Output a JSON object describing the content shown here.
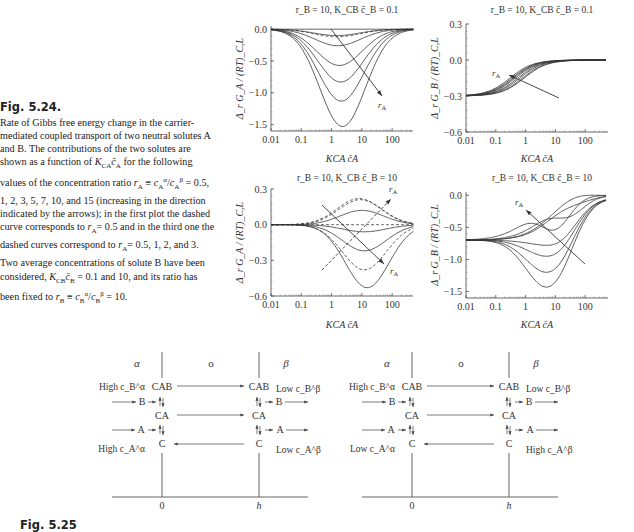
{
  "figure_5_24": {
    "label": "Fig. 5.24.",
    "caption": "Rate of Gibbs free energy change in the carrier-mediated coupled transport of two neutral solutes A and B. The contributions of the two solutes are shown as a function of K_CA c̄_A for the following values of the concentration ratio r_A ≡ c_A^α/c_A^β = 0.5, 1, 2, 3, 5, 7, 10, and 15 (increasing in the direction indicated by the arrows); in the first plot the dashed curve corresponds to r_A= 0.5 and in the third one the dashed curves correspond to r_A= 0.5, 1, 2, and 3. Two average concentrations of solute B have been considered, K_CB c̄_B = 0.1 and 10, and its ratio has been fixed to r_B ≡ c_B^α/c_B^β = 10."
  },
  "figure_5_25": {
    "label": "Fig. 5.25"
  },
  "chart_data": [
    {
      "type": "line",
      "title": "r_B = 10, K_CB c̄_B = 0.1",
      "xlabel": "K_CA c̄_A",
      "ylabel": "Δ_r G_A / (RT)_C,L",
      "xscale": "log",
      "xticks": [
        "0.01",
        "0.1",
        "1",
        "10",
        "100"
      ],
      "yticks": [
        "0.0",
        "−0.5",
        "−1.0",
        "−1.5"
      ],
      "xlim": [
        0.01,
        500
      ],
      "ylim": [
        -1.6,
        0.05
      ],
      "annotation": "r_A (arrow pointing down-right)",
      "series": [
        {
          "r_A": 0.5,
          "style": "dashed",
          "min": -0.12,
          "x_at_min": 1.5
        },
        {
          "r_A": 1,
          "style": "solid",
          "min": 0.0,
          "x_at_min": 1.5
        },
        {
          "r_A": 2,
          "style": "solid",
          "min": -0.1,
          "x_at_min": 1.5
        },
        {
          "r_A": 3,
          "style": "solid",
          "min": -0.26,
          "x_at_min": 1.6
        },
        {
          "r_A": 5,
          "style": "solid",
          "min": -0.57,
          "x_at_min": 1.8
        },
        {
          "r_A": 7,
          "style": "solid",
          "min": -0.83,
          "x_at_min": 2.0
        },
        {
          "r_A": 10,
          "style": "solid",
          "min": -1.13,
          "x_at_min": 2.1
        },
        {
          "r_A": 15,
          "style": "solid",
          "min": -1.53,
          "x_at_min": 2.3
        }
      ]
    },
    {
      "type": "line",
      "title": "r_B = 10, K_CB c̄_B = 0.1",
      "xlabel": "K_CA c̄_A",
      "ylabel": "Δ_r G_B / (RT)_C,L",
      "xscale": "log",
      "xticks": [
        "0.01",
        "0.1",
        "1",
        "10",
        "100"
      ],
      "yticks": [
        "0.3",
        "0.0",
        "−0.3",
        "−0.6"
      ],
      "xlim": [
        0.01,
        500
      ],
      "ylim": [
        -0.6,
        0.3
      ],
      "annotation": "r_A (arrow pointing up-left)",
      "series": [
        {
          "r_A": 0.5,
          "start": -0.3,
          "end": 0.0,
          "x_mid": 0.9
        },
        {
          "r_A": 1,
          "start": -0.3,
          "end": 0.0,
          "x_mid": 0.8
        },
        {
          "r_A": 2,
          "start": -0.3,
          "end": 0.0,
          "x_mid": 0.65
        },
        {
          "r_A": 3,
          "start": -0.3,
          "end": 0.0,
          "x_mid": 0.55
        },
        {
          "r_A": 5,
          "start": -0.3,
          "end": 0.0,
          "x_mid": 0.45
        },
        {
          "r_A": 7,
          "start": -0.3,
          "end": 0.0,
          "x_mid": 0.4
        },
        {
          "r_A": 10,
          "start": -0.3,
          "end": 0.0,
          "x_mid": 0.35
        },
        {
          "r_A": 15,
          "start": -0.3,
          "end": 0.0,
          "x_mid": 0.3
        }
      ]
    },
    {
      "type": "line",
      "title": "r_B = 10, K_CB c̄_B = 10",
      "xlabel": "K_CA c̄_A",
      "ylabel": "Δ_r G_A / (RT)_C,L",
      "xscale": "log",
      "xticks": [
        "0.01",
        "0.1",
        "1",
        "10",
        "100"
      ],
      "yticks": [
        "0.3",
        "0.0",
        "−0.3",
        "−0.6"
      ],
      "xlim": [
        0.01,
        500
      ],
      "ylim": [
        -0.6,
        0.3
      ],
      "annotation": "r_A (two arrows: up-right for dashed, down-right for solid)",
      "series": [
        {
          "r_A": 0.5,
          "style": "dashed",
          "extremum": 0.22,
          "x_at": 8
        },
        {
          "r_A": 1,
          "style": "dashed",
          "extremum": 0.21,
          "x_at": 9
        },
        {
          "r_A": 2,
          "style": "solid",
          "extremum": 0.12,
          "x_at": 10
        },
        {
          "r_A": 3,
          "style": "dashed",
          "extremum": 0.0,
          "x_at": 10
        },
        {
          "r_A": 5,
          "style": "solid",
          "extremum": -0.06,
          "x_at": 12
        },
        {
          "r_A": 7,
          "style": "solid",
          "extremum": -0.22,
          "x_at": 12
        },
        {
          "r_A": 10,
          "style": "dashed",
          "extremum": -0.38,
          "x_at": 12
        },
        {
          "r_A": 15,
          "style": "solid",
          "extremum": -0.53,
          "x_at": 15
        }
      ]
    },
    {
      "type": "line",
      "title": "r_B = 10, K_CB c̄_B = 10",
      "xlabel": "K_CA c̄_A",
      "ylabel": "Δ_r G_B / (RT)_C,L",
      "xscale": "log",
      "xticks": [
        "0.01",
        "0.1",
        "1",
        "10",
        "100"
      ],
      "yticks": [
        "0.0",
        "−0.5",
        "−1.0",
        "−1.5"
      ],
      "xlim": [
        0.01,
        500
      ],
      "ylim": [
        -1.6,
        0.1
      ],
      "annotation": "r_A (arrow pointing up-left)",
      "series": [
        {
          "r_A": 0.5,
          "start": -0.7,
          "extremum": 0.05,
          "x_at": 50
        },
        {
          "r_A": 1,
          "start": -0.7,
          "extremum": -0.05,
          "x_at": 60
        },
        {
          "r_A": 2,
          "start": -0.7,
          "extremum": -0.25,
          "x_at": 30
        },
        {
          "r_A": 3,
          "start": -0.7,
          "extremum": -0.45,
          "x_at": 10
        },
        {
          "r_A": 5,
          "start": -0.7,
          "extremum": -0.78,
          "x_at": 5
        },
        {
          "r_A": 7,
          "start": -0.7,
          "extremum": -0.95,
          "x_at": 5
        },
        {
          "r_A": 10,
          "start": -0.7,
          "extremum": -1.2,
          "x_at": 5
        },
        {
          "r_A": 15,
          "start": -0.7,
          "extremum": -1.43,
          "x_at": 5
        }
      ]
    }
  ],
  "diagrams": [
    {
      "phases": [
        "α",
        "o",
        "β"
      ],
      "positions": [
        "0",
        "h"
      ],
      "left_labels": {
        "top": "High c_B^α",
        "bottom": "High c_A^α"
      },
      "right_labels": {
        "top": "Low c_B^β",
        "bottom": "Low c_A^β"
      },
      "species": [
        "CAB",
        "B",
        "CA",
        "A",
        "C"
      ]
    },
    {
      "phases": [
        "α",
        "o",
        "β"
      ],
      "positions": [
        "0",
        "h"
      ],
      "left_labels": {
        "top": "High c_B^α",
        "bottom": "Low c_A^α"
      },
      "right_labels": {
        "top": "Low c_B^β",
        "bottom": "High c_A^β"
      },
      "species": [
        "CAB",
        "B",
        "CA",
        "A",
        "C"
      ]
    }
  ]
}
